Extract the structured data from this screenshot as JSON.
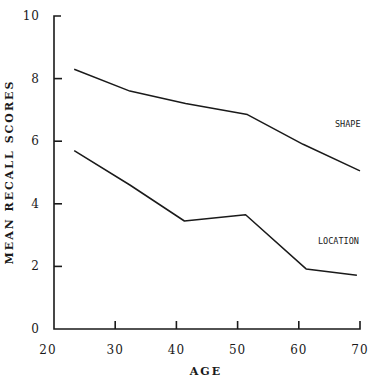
{
  "chart_data": {
    "type": "line",
    "title": "",
    "xlabel": "AGE",
    "ylabel": "MEAN RECALL SCORES",
    "xlim": [
      20,
      70
    ],
    "ylim": [
      0,
      10
    ],
    "xticks": [
      20,
      30,
      40,
      50,
      60,
      70
    ],
    "yticks": [
      0,
      2,
      4,
      6,
      8,
      10
    ],
    "grid": false,
    "legend": "inline labels at right",
    "series": [
      {
        "name": "SHAPE",
        "x": [
          23.3,
          32.4,
          41.5,
          51.6,
          60.7,
          70
        ],
        "values": [
          8.3,
          7.6,
          7.2,
          6.85,
          5.9,
          5.05
        ]
      },
      {
        "name": "LOCATION",
        "x": [
          23.3,
          32.4,
          41.3,
          51.3,
          61.2,
          69.5
        ],
        "values": [
          5.7,
          4.6,
          3.45,
          3.65,
          1.92,
          1.72
        ]
      }
    ]
  },
  "labels": {
    "xlabel": "AGE",
    "ylabel": "MEAN RECALL SCORES",
    "shape": "SHAPE",
    "location": "LOCATION"
  }
}
